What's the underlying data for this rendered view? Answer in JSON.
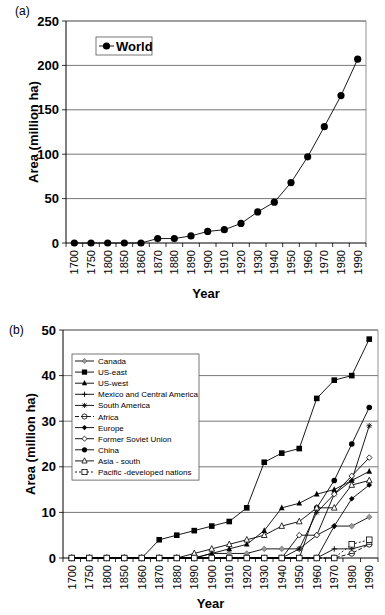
{
  "chart_data": [
    {
      "panel": "(a)",
      "type": "line",
      "title": "",
      "xlabel": "Year",
      "ylabel": "Area (million ha)",
      "ylim": [
        0,
        250
      ],
      "yticks": [
        0,
        50,
        100,
        150,
        200,
        250
      ],
      "grid": true,
      "legend_position": "upper left",
      "categories": [
        "1700",
        "1750",
        "1800",
        "1850",
        "1860",
        "1870",
        "1880",
        "1890",
        "1900",
        "1910",
        "1920",
        "1930",
        "1940",
        "1950",
        "1960",
        "1970",
        "1980",
        "1990"
      ],
      "series": [
        {
          "name": "World",
          "marker": "filled-circle",
          "values": [
            0,
            0,
            0,
            0,
            0,
            5,
            5,
            8,
            13,
            15,
            22,
            35,
            46,
            68,
            97,
            131,
            166,
            207
          ]
        }
      ]
    },
    {
      "panel": "(b)",
      "type": "line",
      "title": "",
      "xlabel": "Year",
      "ylabel": "Area (million ha)",
      "ylim": [
        0,
        50
      ],
      "yticks": [
        0,
        10,
        20,
        30,
        40,
        50
      ],
      "grid": true,
      "legend_position": "upper left",
      "categories": [
        "1700",
        "1750",
        "1800",
        "1850",
        "1860",
        "1870",
        "1880",
        "1890",
        "1900",
        "1910",
        "1920",
        "1930",
        "1940",
        "1950",
        "1960",
        "1970",
        "1980",
        "1990"
      ],
      "series": [
        {
          "name": "Canada",
          "marker": "gray-diamond",
          "dash": "solid",
          "values": [
            0,
            0,
            0,
            0,
            0,
            0,
            0,
            0,
            1,
            1,
            1,
            2,
            2,
            2,
            5,
            7,
            7,
            9
          ]
        },
        {
          "name": "US-east",
          "marker": "filled-square",
          "dash": "solid",
          "values": [
            0,
            0,
            0,
            0,
            0,
            4,
            5,
            6,
            7,
            8,
            11,
            21,
            23,
            24,
            35,
            39,
            40,
            48
          ]
        },
        {
          "name": "US-west",
          "marker": "filled-triangle",
          "dash": "solid",
          "values": [
            0,
            0,
            0,
            0,
            0,
            0,
            0,
            0,
            1,
            2,
            3,
            6,
            11,
            12,
            14,
            15,
            17,
            19
          ]
        },
        {
          "name": "Mexico and Central America",
          "marker": "plus",
          "dash": "solid",
          "values": [
            0,
            0,
            0,
            0,
            0,
            0,
            0,
            0,
            0,
            0,
            0,
            0,
            0,
            0,
            0,
            2,
            2,
            3
          ]
        },
        {
          "name": "South America",
          "marker": "asterisk",
          "dash": "solid",
          "values": [
            0,
            0,
            0,
            0,
            0,
            0,
            0,
            0,
            0,
            0,
            0,
            0,
            0,
            2,
            10,
            14,
            17,
            29
          ]
        },
        {
          "name": "Africa",
          "marker": "open-circle-bar",
          "dash": "dashed",
          "values": [
            0,
            0,
            0,
            0,
            0,
            0,
            0,
            0,
            0,
            0,
            0,
            0,
            0,
            0,
            0,
            0,
            1,
            3
          ]
        },
        {
          "name": "Europe",
          "marker": "filled-diamond",
          "dash": "solid",
          "values": [
            0,
            0,
            0,
            0,
            0,
            0,
            0,
            0,
            0,
            0,
            0,
            0,
            0,
            0,
            0,
            7,
            13,
            16
          ]
        },
        {
          "name": "Former Soviet Union",
          "marker": "open-diamond",
          "dash": "solid",
          "values": [
            0,
            0,
            0,
            0,
            0,
            0,
            0,
            0,
            0,
            0,
            0,
            0,
            0,
            5,
            5,
            14,
            18,
            22
          ]
        },
        {
          "name": "China",
          "marker": "filled-circle",
          "dash": "solid",
          "values": [
            0,
            0,
            0,
            0,
            0,
            0,
            0,
            0,
            0,
            0,
            0,
            0,
            0,
            0,
            11,
            17,
            25,
            33
          ]
        },
        {
          "name": "Asia - south",
          "marker": "open-triangle",
          "dash": "solid",
          "values": [
            0,
            0,
            0,
            0,
            0,
            0,
            0,
            1,
            2,
            3,
            4,
            5,
            7,
            8,
            11,
            11,
            16,
            17
          ]
        },
        {
          "name": "Pacific -developed nations",
          "marker": "open-square",
          "dash": "dotted",
          "values": [
            0,
            0,
            0,
            0,
            0,
            0,
            0,
            0,
            0,
            0,
            0,
            0,
            0,
            0,
            0,
            0,
            3,
            4
          ]
        }
      ]
    }
  ],
  "labels": {
    "panel_a": "(a)",
    "panel_b": "(b)",
    "xlabel": "Year",
    "ylabel": "Area (million ha)",
    "legend_a": "World"
  }
}
